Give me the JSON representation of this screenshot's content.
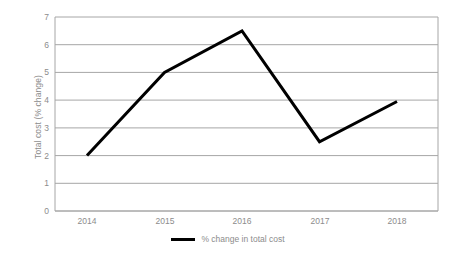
{
  "chart_data": {
    "type": "line",
    "title": "",
    "subtitle": "",
    "xlabel": "",
    "ylabel": "Total cost (% change)",
    "categories": [
      "2014",
      "2015",
      "2016",
      "2017",
      "2018"
    ],
    "x_tick_labels": [
      "2014",
      "2015",
      "2016",
      "2017",
      "2018"
    ],
    "y_tick_labels": [
      "0",
      "1",
      "2",
      "3",
      "4",
      "5",
      "6",
      "7"
    ],
    "y_tick_values": [
      0,
      1,
      2,
      3,
      4,
      5,
      6,
      7
    ],
    "ylim": [
      0,
      7
    ],
    "grid": "horizontal",
    "legend_position": "bottom-center",
    "series": [
      {
        "name": "% change in total cost",
        "color": "#000000",
        "values": [
          2.0,
          5.0,
          6.5,
          2.5,
          3.95
        ]
      }
    ],
    "annotations": []
  },
  "legend": {
    "entries": [
      {
        "label": "% change in total cost",
        "marker": "line-swatch",
        "color": "#000000"
      }
    ]
  },
  "colors": {
    "series_line": "#000000",
    "gridline": "#a6a6a6",
    "axis_line": "#a6a6a6",
    "tick_text": "#8c8c8c",
    "plot_background": "#ffffff"
  }
}
